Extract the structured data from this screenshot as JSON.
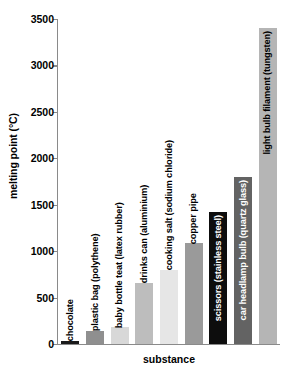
{
  "chart_data": {
    "type": "bar",
    "title": "",
    "xlabel": "substance",
    "ylabel": "melting point (°C)",
    "ylim": [
      0,
      3500
    ],
    "ytick_labels": [
      "0",
      "500",
      "1000",
      "1500",
      "2000",
      "2500",
      "3000",
      "3500"
    ],
    "yticks": [
      0,
      500,
      1000,
      1500,
      2000,
      2500,
      3000,
      3500
    ],
    "grid": false,
    "legend": null,
    "categories": [
      "chocolate",
      "plastic bag (polythene)",
      "baby bottle teat (latex rubber)",
      "drinks can (aluminium)",
      "cooking salt (sodium chloride)",
      "copper pipe",
      "scissors (stainless steel)",
      "car headlamp bulb (quartz glass)",
      "light bulb filament (tungsten)"
    ],
    "values": [
      35,
      145,
      180,
      660,
      800,
      1085,
      1425,
      1800,
      3400
    ],
    "bar_colors": [
      "#1a1a1a",
      "#8f8f8f",
      "#d8d8d8",
      "#bdbdbd",
      "#e6e6e6",
      "#9a9a9a",
      "#0d0d0d",
      "#636363",
      "#b5b5b5"
    ],
    "label_placement": [
      "over",
      "over",
      "over",
      "over",
      "over",
      "over",
      "inside",
      "inside",
      "inside"
    ],
    "label_colors": [
      "#000000",
      "#000000",
      "#000000",
      "#000000",
      "#000000",
      "#000000",
      "#ffffff",
      "#ffffff",
      "#000000"
    ],
    "axis_color": "#8a8a8a"
  }
}
